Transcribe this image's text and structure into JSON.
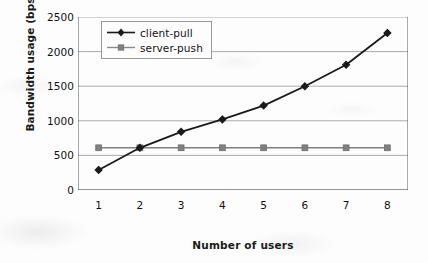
{
  "chart_data": {
    "type": "line",
    "title": "",
    "xlabel": "Number of users",
    "ylabel": "Bandwidth usage (bps)",
    "x": [
      1,
      2,
      3,
      4,
      5,
      6,
      7,
      8
    ],
    "xticklabels": [
      "1",
      "2",
      "3",
      "4",
      "5",
      "6",
      "7",
      "8"
    ],
    "xlim": [
      0.5,
      8.5
    ],
    "ylim": [
      0,
      2500
    ],
    "yticks": [
      0,
      500,
      1000,
      1500,
      2000,
      2500
    ],
    "yticklabels": [
      "0",
      "500",
      "1000",
      "1500",
      "2000",
      "2500"
    ],
    "grid": "horizontal",
    "legend_position": "upper left inside axes",
    "series": [
      {
        "name": "client-pull",
        "values": [
          290,
          610,
          840,
          1020,
          1220,
          1500,
          1810,
          2270
        ],
        "color": "#1a1a1a",
        "marker": "diamond"
      },
      {
        "name": "server-push",
        "values": [
          610,
          610,
          610,
          610,
          610,
          610,
          610,
          610
        ],
        "color": "#808080",
        "marker": "square"
      }
    ]
  },
  "axes": {
    "gridline_color": "#aaaaaa",
    "axis_color": "#555555",
    "background": "#fdfdfd"
  },
  "legend": {
    "entries": [
      {
        "label": "client-pull"
      },
      {
        "label": "server-push"
      }
    ]
  }
}
